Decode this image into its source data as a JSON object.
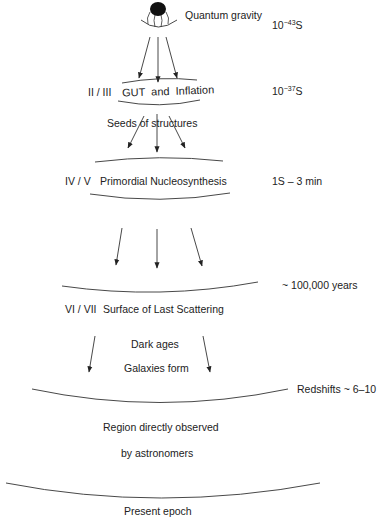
{
  "diagram": {
    "stages": [
      {
        "numeral": "",
        "label": "Quantum gravity",
        "time": {
          "base": "10",
          "exp": "−43",
          "unit": "S"
        }
      },
      {
        "numeral": "II / III",
        "label_parts": [
          "GUT",
          "and",
          "Inflation"
        ],
        "time": {
          "base": "10",
          "exp": "−37",
          "unit": "S"
        }
      },
      {
        "label": "Seeds of structures"
      },
      {
        "numeral": "IV / V",
        "label": "Primordial Nucleosynthesis",
        "time_text": "1S – 3 min"
      },
      {
        "time_text": "~ 100,000 years"
      },
      {
        "numeral": "VI / VII",
        "label": "Surface of Last Scattering"
      },
      {
        "label": "Dark ages"
      },
      {
        "label": "Galaxies form"
      },
      {
        "time_text": "Redshifts ~ 6–10"
      },
      {
        "label": "Region directly observed"
      },
      {
        "label": "by astronomers"
      },
      {
        "label": "Present epoch"
      }
    ],
    "icons": [
      "big-bang-singularity-icon",
      "arrow-down-icon"
    ],
    "colors": {
      "line": "#333333",
      "text": "#222222",
      "background": "#ffffff"
    }
  }
}
